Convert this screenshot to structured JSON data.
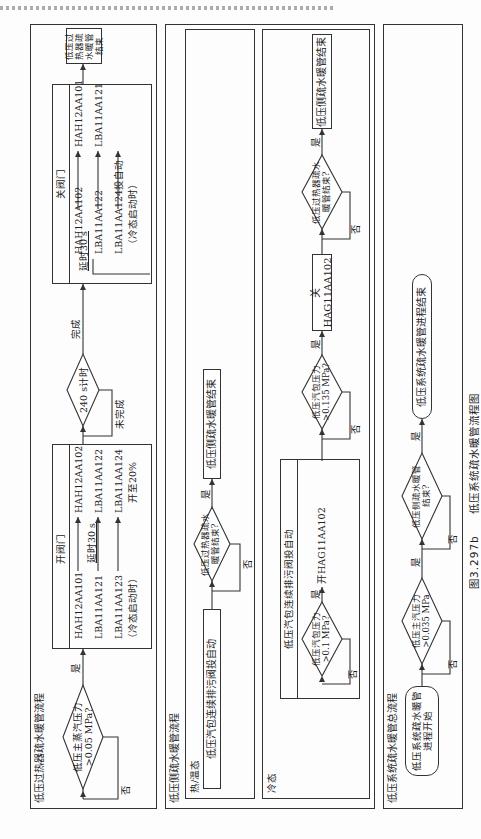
{
  "figure": {
    "number": "图3.297b",
    "title": "低压系统疏水暖管流程图"
  },
  "sections": {
    "superheater": {
      "title": "低压过热器疏水暖管流程",
      "decision_pressure": "低压主蒸汽压力 >0.05 MPa?",
      "yes": "是",
      "no": "否",
      "open_valves": {
        "title": "开阀门",
        "col1": [
          "HAH12AA101",
          "LBA11AA121",
          "LBA11AA123",
          "（冷态启动时）"
        ],
        "delay": "延时30 s",
        "col2": [
          "HAH12AA102",
          "LBA11AA122",
          "LBA11AA124",
          "开至20%"
        ]
      },
      "timer": "240 s计时",
      "done": "完成",
      "not_done": "未完成",
      "close_valves": {
        "title": "关阀门",
        "delay": "延时30 s",
        "col1": [
          "HAH12AA102",
          "LBA11AA122",
          "LBA11AA124投自动",
          "（冷态启动时）"
        ],
        "col2": [
          "HAH12AA101",
          "LBA11AA121"
        ]
      },
      "end": "低压过热器疏水暖管结束"
    },
    "side": {
      "title": "低压侧疏水暖管流程",
      "hot": {
        "title": "热/温态",
        "action": "低压汽包连续排污阀投自动",
        "decision": "低压过热器疏水暖管结束?",
        "yes": "是",
        "no": "否",
        "end": "低压侧疏水暖管结束"
      },
      "cold": {
        "title": "冷态",
        "subbox_title": "低压汽包连续排污阀投自动",
        "decision1": "低压汽包压力 >0.1 MPa?",
        "yes1": "是",
        "no1": "否",
        "action1": "开HAG11AA102",
        "decision2": "低压汽包压力 >0.135 MPa?",
        "yes2": "是",
        "no2": "否",
        "action2": "关HAG11AA102",
        "decision3": "低压过热器疏水暖管结束?",
        "yes3": "是",
        "no3": "否",
        "end": "低压侧疏水暖管结束"
      }
    },
    "overall": {
      "title": "低压系统疏水暖管总流程",
      "start": "低压系统疏水暖管进程开始",
      "decision1": "低压主汽压力 >0.035 MPa",
      "no1": "否",
      "yes1": "是",
      "decision2": "低压侧疏水暖管结束?",
      "no2": "否",
      "yes2": "是",
      "end": "低压系统疏水暖管进程结束"
    }
  }
}
